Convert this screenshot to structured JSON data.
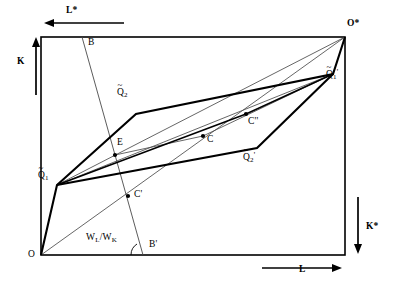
{
  "figure": {
    "title": "",
    "type": "economics-edgeworth-box-diagram",
    "colors": {
      "stroke": "#000000",
      "background": "#ffffff",
      "thin": "#3a3a3a"
    },
    "box": {
      "left": 41,
      "top": 37,
      "right": 345,
      "bottom": 255
    },
    "axes": [
      {
        "name": "K",
        "label": "K",
        "label_x": 20,
        "label_y": 62,
        "arrow": "up",
        "x": 36,
        "y1": 95,
        "y2": 40
      },
      {
        "name": "L-star",
        "label": "L*",
        "label_x": 68,
        "label_y": 8,
        "arrow": "left",
        "y": 23,
        "x1": 124,
        "x2": 45
      },
      {
        "name": "K-star",
        "label": "K*",
        "label_x": 368,
        "label_y": 228,
        "arrow": "down",
        "x": 358,
        "y1": 197,
        "y2": 252
      },
      {
        "name": "L",
        "label": "L",
        "label_x": 301,
        "label_y": 272,
        "arrow": "right",
        "y": 268,
        "x1": 262,
        "x2": 341
      }
    ],
    "points": [
      {
        "id": "O",
        "label": "O",
        "x": 41,
        "y": 255,
        "label_x": 30,
        "label_y": 255,
        "dot": false
      },
      {
        "id": "Ostar",
        "label": "O*",
        "x": 345,
        "y": 37,
        "label_x": 348,
        "label_y": 26,
        "dot": false
      },
      {
        "id": "Q1t",
        "label": "Q1-tilde",
        "x": 57,
        "y": 185,
        "label_x": 39,
        "label_y": 176,
        "dot": false
      },
      {
        "id": "Q1tp",
        "label": "Q1-tilde-prime",
        "x": 333,
        "y": 74,
        "label_x": 330,
        "label_y": 79,
        "dot": false
      },
      {
        "id": "Q2t",
        "label": "Q2-tilde",
        "x": 136,
        "y": 114,
        "label_x": 118,
        "label_y": 92,
        "dot": false
      },
      {
        "id": "Q2tp",
        "label": "Q2-tilde-prime",
        "x": 257,
        "y": 148,
        "label_x": 243,
        "label_y": 157,
        "dot": false
      },
      {
        "id": "B",
        "label": "B",
        "x": 82,
        "y": 37,
        "label_x": 89,
        "label_y": 42,
        "dot": false
      },
      {
        "id": "Bprime",
        "label": "B'",
        "x": 143,
        "y": 255,
        "label_x": 150,
        "label_y": 245,
        "dot": false
      },
      {
        "id": "E",
        "label": "E",
        "x": 115,
        "y": 155,
        "label_x": 118,
        "label_y": 142,
        "dot": true
      },
      {
        "id": "C",
        "label": "C",
        "x": 203,
        "y": 136,
        "label_x": 208,
        "label_y": 139,
        "dot": true
      },
      {
        "id": "Cprime",
        "label": "C'",
        "x": 128,
        "y": 196,
        "label_x": 135,
        "label_y": 194,
        "dot": true
      },
      {
        "id": "Cdprime",
        "label": "C''",
        "x": 246,
        "y": 114,
        "label_x": 249,
        "label_y": 121,
        "dot": true
      }
    ],
    "wage_ratio": {
      "label": "W_L/W_K",
      "numerator": "W",
      "numerator_sub": "L",
      "denominator": "W",
      "denominator_sub": "K",
      "x": 88,
      "y": 238
    },
    "isoquants": {
      "lower_firm1": {
        "name": "Q1-tilde isoquant (lower-left, bold)",
        "points": "41,255 57,185 136,114 333,74 345,37"
      },
      "upper_firm2": {
        "name": "Q2-tilde isoquant (upper, bold)",
        "points": "57,185 136,114 333,74"
      },
      "lower_firm2": {
        "name": "Q2-tilde-prime isoquant (lower, bold)",
        "points": "57,185 257,148 333,74"
      }
    },
    "lines": {
      "budget_BBprime": {
        "name": "B-B' price line",
        "x1": 82,
        "y1": 37,
        "x2": 143,
        "y2": 255
      },
      "ray_O_Ostar": {
        "name": "diagonal O to O*",
        "x1": 41,
        "y1": 255,
        "x2": 345,
        "y2": 37
      },
      "ray_Q1t_Ostar": {
        "name": "Q1-tilde to O*",
        "x1": 57,
        "y1": 185,
        "x2": 345,
        "y2": 37
      },
      "ray_Q1t_Q1tp": {
        "name": "Q1-tilde to Q1-tilde-prime",
        "x1": 57,
        "y1": 185,
        "x2": 333,
        "y2": 74
      },
      "seg_E_C": {
        "name": "E to C efficiency chord",
        "x1": 115,
        "y1": 155,
        "x2": 203,
        "y2": 136
      },
      "seg_Q1t_C": {
        "name": "Q1-tilde through C to Q1-tilde-prime",
        "x1": 57,
        "y1": 185,
        "x2": 203,
        "y2": 136
      }
    }
  }
}
